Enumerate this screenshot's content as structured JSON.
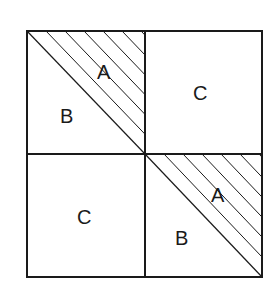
{
  "diagram": {
    "quadrants": {
      "top_left": {
        "hatched_label": "A",
        "plain_label": "B"
      },
      "top_right": {
        "label": "C"
      },
      "bottom_left": {
        "label": "C"
      },
      "bottom_right": {
        "hatched_label": "A",
        "plain_label": "B"
      }
    },
    "colors": {
      "stroke": "#1a1a1a",
      "background": "#ffffff"
    }
  }
}
